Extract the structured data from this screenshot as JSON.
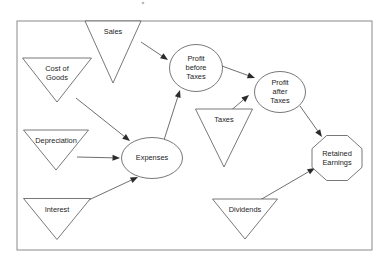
{
  "diagram": {
    "frame": {
      "x": 17,
      "y": 21,
      "width": 355,
      "height": 229,
      "color": "#8a8a8a"
    },
    "style": {
      "shape_stroke": "#555555",
      "edge_stroke": "#4a4a4a",
      "arrow_fill": "#2b2b2b",
      "background": "#ffffff",
      "text_color": "#1c1c1c"
    },
    "nodes": [
      {
        "id": "sales",
        "label": "Sales",
        "shape": "triangle-down",
        "cx": 113,
        "cy": 52,
        "w": 56,
        "h": 62
      },
      {
        "id": "cost_of_goods",
        "label": "Cost of\nGoods",
        "shape": "triangle-down",
        "cx": 57,
        "cy": 80,
        "w": 69,
        "h": 44
      },
      {
        "id": "depreciation",
        "label": "Depreciation",
        "shape": "triangle-down",
        "cx": 56,
        "cy": 150,
        "w": 65,
        "h": 40
      },
      {
        "id": "interest",
        "label": "Interest",
        "shape": "triangle-down",
        "cx": 57,
        "cy": 219,
        "w": 67,
        "h": 41
      },
      {
        "id": "expenses",
        "label": "Expenses",
        "shape": "ellipse",
        "cx": 152,
        "cy": 158,
        "w": 61,
        "h": 41
      },
      {
        "id": "profit_before",
        "label": "Profit\nbefore\nTaxes",
        "shape": "ellipse",
        "cx": 196,
        "cy": 68,
        "w": 53,
        "h": 47
      },
      {
        "id": "taxes",
        "label": "Taxes",
        "shape": "triangle-down",
        "cx": 224,
        "cy": 138,
        "w": 57,
        "h": 58
      },
      {
        "id": "profit_after",
        "label": "Profit\nafter\nTaxes",
        "shape": "ellipse",
        "cx": 280,
        "cy": 92,
        "w": 51,
        "h": 41
      },
      {
        "id": "dividends",
        "label": "Dividends",
        "shape": "triangle-down",
        "cx": 245,
        "cy": 219,
        "w": 65,
        "h": 40
      },
      {
        "id": "retained",
        "label": "Retained\nEarnings",
        "shape": "octagon",
        "cx": 337,
        "cy": 158,
        "w": 50,
        "h": 45
      }
    ],
    "edges": [
      {
        "from": "sales",
        "to": "profit_before",
        "x1": 141,
        "y1": 42,
        "x2": 168,
        "y2": 60
      },
      {
        "from": "cost_of_goods",
        "to": "expenses",
        "x1": 76,
        "y1": 98,
        "x2": 130,
        "y2": 141
      },
      {
        "from": "depreciation",
        "to": "expenses",
        "x1": 77,
        "y1": 157,
        "x2": 120,
        "y2": 158
      },
      {
        "from": "interest",
        "to": "expenses",
        "x1": 78,
        "y1": 205,
        "x2": 138,
        "y2": 177
      },
      {
        "from": "expenses",
        "to": "profit_before",
        "x1": 164,
        "y1": 140,
        "x2": 180,
        "y2": 90
      },
      {
        "from": "profit_before",
        "to": "profit_after",
        "x1": 222,
        "y1": 66,
        "x2": 255,
        "y2": 78
      },
      {
        "from": "taxes",
        "to": "profit_after",
        "x1": 221,
        "y1": 119,
        "x2": 249,
        "y2": 95
      },
      {
        "from": "profit_after",
        "to": "retained",
        "x1": 300,
        "y1": 106,
        "x2": 322,
        "y2": 137
      },
      {
        "from": "dividends",
        "to": "retained",
        "x1": 248,
        "y1": 207,
        "x2": 315,
        "y2": 168
      }
    ],
    "artifact": {
      "name": "scan-speck",
      "x": 143,
      "y": 3,
      "r": 1.3
    }
  }
}
